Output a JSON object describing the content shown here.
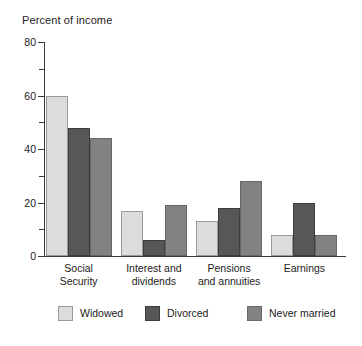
{
  "chart_data": {
    "type": "bar",
    "title": "Percent of income",
    "xlabel": "",
    "ylabel": "",
    "ylim": [
      0,
      80
    ],
    "yticks": [
      0,
      20,
      40,
      60,
      80
    ],
    "yticks_minor": [
      10,
      30,
      50,
      70
    ],
    "grid": false,
    "legend_position": "bottom",
    "categories": [
      "Social\nSecurity",
      "Interest and\ndividends",
      "Pensions\nand annuities",
      "Earnings"
    ],
    "series": [
      {
        "name": "Widowed",
        "color": "#dcdcdc",
        "values": [
          60,
          17,
          13,
          8
        ]
      },
      {
        "name": "Divorced",
        "color": "#575757",
        "values": [
          48,
          6,
          18,
          20
        ]
      },
      {
        "name": "Never married",
        "color": "#828282",
        "values": [
          44,
          19,
          28,
          8
        ]
      }
    ]
  },
  "legend": {
    "items": [
      {
        "label": "Widowed"
      },
      {
        "label": "Divorced"
      },
      {
        "label": "Never married"
      }
    ]
  }
}
